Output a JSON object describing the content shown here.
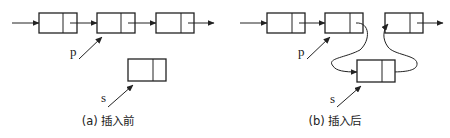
{
  "diagram": {
    "type": "linked-list-insertion",
    "colors": {
      "stroke": "#222222",
      "background": "#ffffff"
    },
    "panels": [
      {
        "id": "before",
        "caption": "(a) 插入前",
        "list_nodes": 3,
        "pointer_p": "p",
        "pointer_s": "s",
        "new_node": "s-node (unlinked)"
      },
      {
        "id": "after",
        "caption": "(b) 插入后",
        "list_nodes": 3,
        "pointer_p": "p",
        "pointer_s": "s",
        "new_node": "s-node (linked between p and p.next)"
      }
    ]
  }
}
